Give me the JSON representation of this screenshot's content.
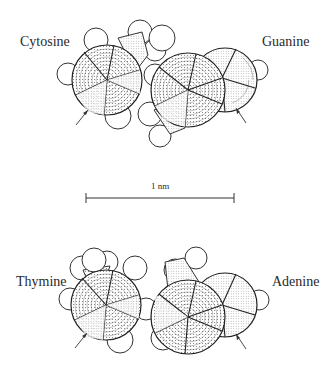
{
  "figure": {
    "type": "space-filling molecular models of DNA base pairs",
    "base_pairs": [
      {
        "name": "cytosine-guanine",
        "bases": [
          {
            "name": "Cytosine",
            "label": "Cytosine",
            "position": "top-left"
          },
          {
            "name": "Guanine",
            "label": "Guanine",
            "position": "top-right"
          }
        ]
      },
      {
        "name": "thymine-adenine",
        "bases": [
          {
            "name": "Thymine",
            "label": "Thymine",
            "position": "bottom-left"
          },
          {
            "name": "Adenine",
            "label": "Adenine",
            "position": "bottom-right"
          }
        ]
      }
    ],
    "scale_bar": {
      "label": "1 nm"
    },
    "colors": {
      "ink": "#2a2a2a",
      "background": "#ffffff"
    }
  }
}
